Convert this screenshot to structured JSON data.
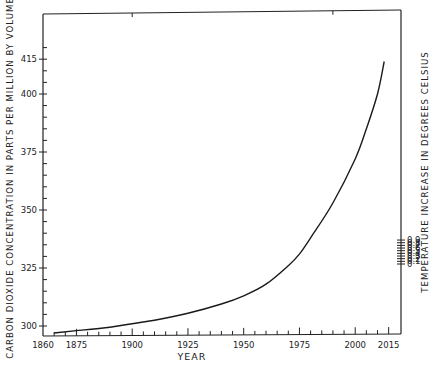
{
  "chart_data": {
    "type": "line",
    "title": "",
    "xlabel": "YEAR",
    "ylabel": "CARBON DIOXIDE CONCENTRATION IN PARTS PER MILLION BY VOLUME",
    "ylabel_right": "TEMPERATURE INCREASE IN DEGREES CELSIUS",
    "xlim": [
      1860,
      2015
    ],
    "ylim": [
      296,
      424
    ],
    "x_ticks": [
      "1860",
      "1875",
      "1900",
      "1925",
      "1950",
      "1975",
      "2000",
      "2015"
    ],
    "y_ticks": [
      "300",
      "325",
      "350",
      "375",
      "400",
      "415"
    ],
    "y_right_ticks": [
      "0",
      "0.1",
      "0.2",
      "0.3",
      "0.4",
      "0.5",
      "0.6",
      "0.7",
      "0.8",
      "0.9"
    ],
    "grid": false,
    "legend": null,
    "series": [
      {
        "name": "CO2 concentration (ppm)",
        "x": [
          1865,
          1875,
          1890,
          1900,
          1910,
          1925,
          1940,
          1950,
          1960,
          1970,
          1975,
          1980,
          1990,
          2000,
          2005,
          2010,
          2013
        ],
        "values": [
          297,
          298,
          299.5,
          301,
          302.5,
          305.5,
          309.5,
          313,
          318,
          326,
          331,
          338,
          353,
          372,
          385,
          400,
          414
        ]
      }
    ]
  }
}
